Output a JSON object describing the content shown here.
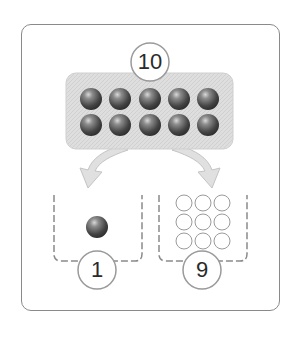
{
  "diagram": {
    "total": {
      "value": "10",
      "balls": 10,
      "rows": 2,
      "cols": 5
    },
    "parts": [
      {
        "name": "left",
        "value": "1",
        "filled_balls": 1,
        "empty_circles": 0
      },
      {
        "name": "right",
        "value": "9",
        "filled_balls": 0,
        "empty_circles": 9
      }
    ],
    "colors": {
      "frame": "#8a8a8a",
      "tray": "#dcdcdc",
      "ball_dark": "#3a3a3a",
      "ball_light": "#9a9a9a",
      "bin_dashes": "#8a8a8a",
      "arrow": "#e2e2e2"
    }
  }
}
